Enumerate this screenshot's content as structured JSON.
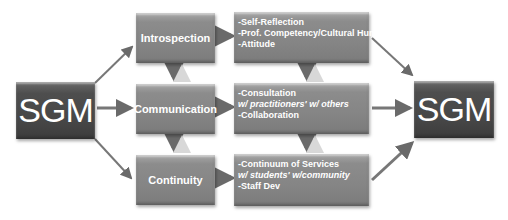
{
  "diagram": {
    "source_node": {
      "label": "SGM"
    },
    "target_node": {
      "label": "SGM"
    },
    "stages": [
      {
        "label": "Introspection",
        "details": [
          "-Self-Reflection",
          "-Prof. Competency/Cultural Humility",
          "-Attitude"
        ]
      },
      {
        "label": "Communication",
        "details": [
          "-Consultation",
          "w/ practitioners' w/ others",
          "-Collaboration"
        ]
      },
      {
        "label": "Continuity",
        "details": [
          "-Continuum of Services",
          "w/ students' w/community",
          "-Staff Dev"
        ]
      }
    ],
    "colors": {
      "sgm_box": "#4a4a4a",
      "stage_box": "#8a8a8a",
      "arrow": "#707070",
      "text": "#ffffff"
    }
  }
}
